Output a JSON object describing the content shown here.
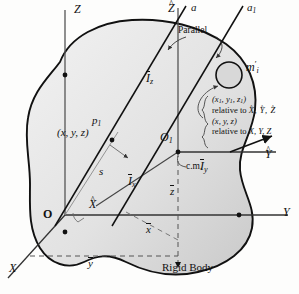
{
  "figure": {
    "caption": "Rigid Body"
  },
  "axes": {
    "Z": "Z",
    "Y": "Y",
    "X": "X",
    "Z_hat": "Z",
    "Y_hat": "Y",
    "X_hat": "X"
  },
  "lines": {
    "a": "a",
    "a1": "a",
    "a1_sub": "1",
    "parallel_note": "Parallel"
  },
  "inertia": {
    "Iz": "I",
    "Iz_sub": "z",
    "Ix": "I",
    "Ix_sub": "x",
    "Iy": "I",
    "Iy_sub": "y"
  },
  "points": {
    "origin": "O",
    "O1": "O",
    "O1_sub": "1",
    "p1": "p",
    "p1_sub": "1",
    "p1_coords": "(x, y, z)",
    "cm": "c.m.",
    "s": "s",
    "mass_el": "m",
    "mass_el_prime": "′",
    "mass_el_sub": "i"
  },
  "centroid_offsets": {
    "ybar": "y",
    "zbar": "z",
    "xbar": "x"
  },
  "annotation": {
    "line1": "(x",
    "line1_s1": "1",
    "line1_b": ", y",
    "line1_s2": "1",
    "line1_c": ", z",
    "line1_s3": "1",
    "line1_d": ")",
    "line2_pre": "relative to ",
    "line2_axes": "X, Y, Z",
    "line3": "(x, y, z)",
    "line4_pre": "relative to ",
    "line4_axes": "X, Y, Z"
  },
  "colors": {
    "body_fill_light": "#efefef",
    "body_fill_dark": "#cfcfcf",
    "outline": "#111111",
    "axis": "#444444",
    "thin": "#777777"
  }
}
